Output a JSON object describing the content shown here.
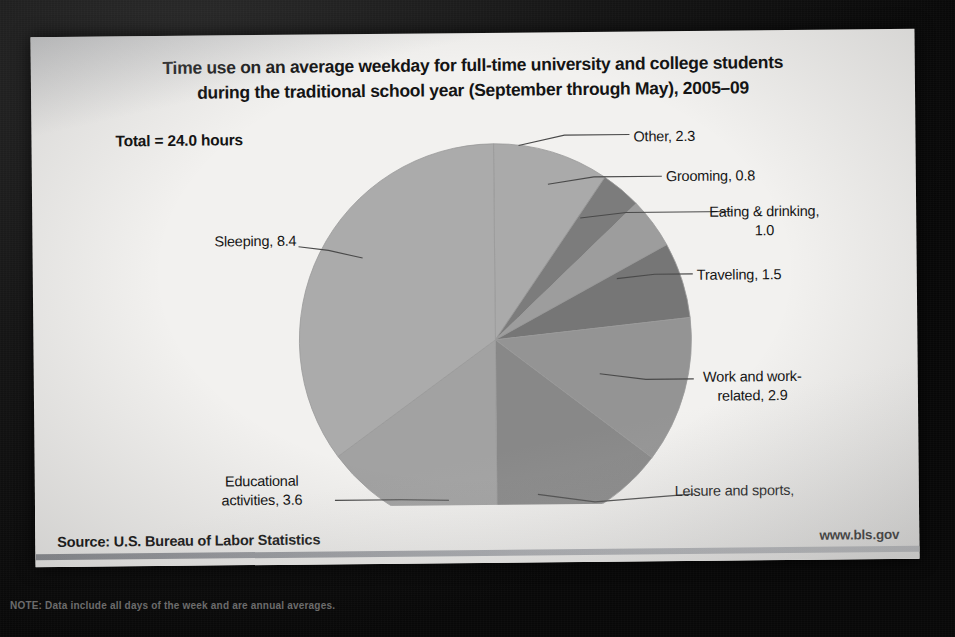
{
  "slide": {
    "title_line1": "Time use on an average weekday for full-time university and college students",
    "title_line2": "during the traditional school year (September through May), 2005–09",
    "total_note": "Total = 24.0  hours",
    "source": "Source: U.S. Bureau of Labor Statistics",
    "url": "www.bls.gov",
    "note_strip": "NOTE: Data include all days of the week and are annual averages."
  },
  "chart_data": {
    "type": "pie",
    "title": "Time use on an average weekday for full-time university and college students during the traditional school year (September through May), 2005–09",
    "unit": "hours",
    "total": 24.0,
    "total_label": "Total = 24.0  hours",
    "legend": "none",
    "start_angle_deg": 0,
    "direction": "clockwise",
    "categories": [
      "Other",
      "Grooming",
      "Eating & drinking",
      "Traveling",
      "Work and work-related",
      "Leisure and sports",
      "Educational activities",
      "Sleeping"
    ],
    "values": [
      2.3,
      0.8,
      1.0,
      1.5,
      2.9,
      3.5,
      3.6,
      8.4
    ],
    "colors": [
      "#aaaaaa",
      "#7c7c7c",
      "#9d9d9d",
      "#767676",
      "#949494",
      "#888888",
      "#a2a2a2",
      "#ababab"
    ],
    "slices": [
      {
        "label": "Other, 2.3",
        "name": "Other",
        "value": 2.3,
        "color": "#aaaaaa"
      },
      {
        "label": "Grooming, 0.8",
        "name": "Grooming",
        "value": 0.8,
        "color": "#7c7c7c"
      },
      {
        "label": "Eating & drinking,\n1.0",
        "name": "Eating & drinking",
        "value": 1.0,
        "color": "#9d9d9d"
      },
      {
        "label": "Traveling, 1.5",
        "name": "Traveling",
        "value": 1.5,
        "color": "#767676"
      },
      {
        "label": "Work and work-\nrelated, 2.9",
        "name": "Work and work-related",
        "value": 2.9,
        "color": "#949494"
      },
      {
        "label": "Leisure and sports,\n3.5",
        "name": "Leisure and sports",
        "value": 3.5,
        "color": "#888888"
      },
      {
        "label": "Educational\nactivities, 3.6",
        "name": "Educational activities",
        "value": 3.6,
        "color": "#a2a2a2"
      },
      {
        "label": "Sleeping, 8.4",
        "name": "Sleeping",
        "value": 8.4,
        "color": "#ababab"
      }
    ]
  },
  "labels": {
    "other": "Other, 2.3",
    "grooming": "Grooming, 0.8",
    "eating": "Eating & drinking,\n1.0",
    "traveling": "Traveling, 1.5",
    "work": "Work and work-\nrelated, 2.9",
    "leisure": "Leisure and sports,\n3.5",
    "education": "Educational\nactivities, 3.6",
    "sleeping": "Sleeping, 8.4"
  }
}
